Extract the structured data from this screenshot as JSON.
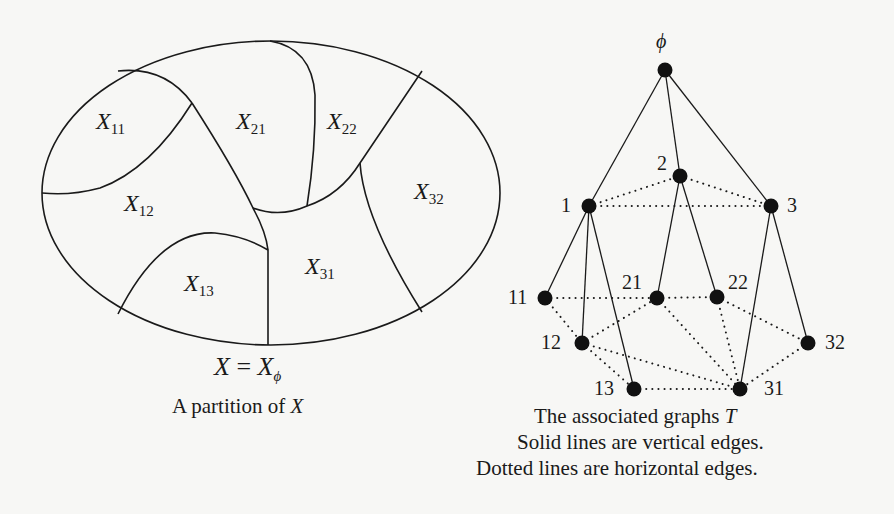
{
  "left_panel": {
    "title": "A partition of X",
    "caption_prefix": "A partition of ",
    "caption_var": "X",
    "equation": {
      "lhs": "X",
      "op": "=",
      "rhs": "X",
      "rhs_sub": "ϕ"
    },
    "regions": [
      {
        "id": "X11",
        "base": "X",
        "sub": "11"
      },
      {
        "id": "X12",
        "base": "X",
        "sub": "12"
      },
      {
        "id": "X13",
        "base": "X",
        "sub": "13"
      },
      {
        "id": "X21",
        "base": "X",
        "sub": "21"
      },
      {
        "id": "X22",
        "base": "X",
        "sub": "22"
      },
      {
        "id": "X31",
        "base": "X",
        "sub": "31"
      },
      {
        "id": "X32",
        "base": "X",
        "sub": "32"
      }
    ]
  },
  "right_panel": {
    "caption_line1_prefix": "The associated graphs ",
    "caption_line1_var": "T",
    "caption_line2": "Solid lines are vertical edges.",
    "caption_line3": "Dotted lines are horizontal edges.",
    "graph": {
      "nodes": [
        {
          "id": "phi",
          "label": "ϕ",
          "x": 665,
          "y": 70
        },
        {
          "id": "1",
          "label": "1",
          "x": 589,
          "y": 206
        },
        {
          "id": "2",
          "label": "2",
          "x": 680,
          "y": 176
        },
        {
          "id": "3",
          "label": "3",
          "x": 771,
          "y": 206
        },
        {
          "id": "11",
          "label": "11",
          "x": 545,
          "y": 298
        },
        {
          "id": "12",
          "label": "12",
          "x": 582,
          "y": 343
        },
        {
          "id": "13",
          "label": "13",
          "x": 634,
          "y": 389
        },
        {
          "id": "21",
          "label": "21",
          "x": 657,
          "y": 298
        },
        {
          "id": "22",
          "label": "22",
          "x": 717,
          "y": 297
        },
        {
          "id": "31",
          "label": "31",
          "x": 740,
          "y": 389
        },
        {
          "id": "32",
          "label": "32",
          "x": 808,
          "y": 343
        }
      ],
      "vertical_edges": [
        [
          "phi",
          "1"
        ],
        [
          "phi",
          "2"
        ],
        [
          "phi",
          "3"
        ],
        [
          "1",
          "11"
        ],
        [
          "1",
          "12"
        ],
        [
          "1",
          "13"
        ],
        [
          "2",
          "21"
        ],
        [
          "2",
          "22"
        ],
        [
          "3",
          "31"
        ],
        [
          "3",
          "32"
        ]
      ],
      "horizontal_edges": [
        [
          "1",
          "2"
        ],
        [
          "2",
          "3"
        ],
        [
          "1",
          "3"
        ],
        [
          "11",
          "21"
        ],
        [
          "21",
          "22"
        ],
        [
          "11",
          "12"
        ],
        [
          "12",
          "21"
        ],
        [
          "12",
          "13"
        ],
        [
          "12",
          "31"
        ],
        [
          "21",
          "31"
        ],
        [
          "22",
          "31"
        ],
        [
          "22",
          "32"
        ],
        [
          "13",
          "31"
        ],
        [
          "32",
          "31"
        ]
      ]
    }
  }
}
